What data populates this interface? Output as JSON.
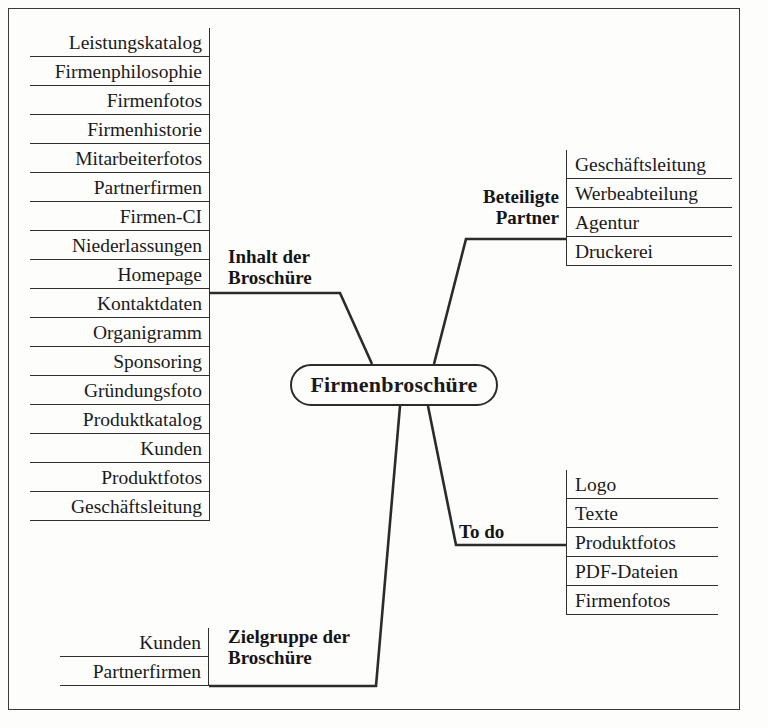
{
  "diagram": {
    "title": "Firmenbroschüre",
    "type": "mind-map",
    "ink_color": "#2b2b2b",
    "paper_color": "#fdfdfc"
  },
  "central": {
    "label": "Firmenbroschüre"
  },
  "branches": {
    "inhalt": {
      "label": "Inhalt der\nBroschüre",
      "items": [
        "Leistungskatalog",
        "Firmenphilosophie",
        "Firmenfotos",
        "Firmenhistorie",
        "Mitarbeiterfotos",
        "Partnerfirmen",
        "Firmen-CI",
        "Niederlassungen",
        "Homepage",
        "Kontaktdaten",
        "Organigramm",
        "Sponsoring",
        "Gründungsfoto",
        "Produktkatalog",
        "Kunden",
        "Produktfotos",
        "Geschäftsleitung"
      ]
    },
    "partner": {
      "label": "Beteiligte\nPartner",
      "items": [
        "Geschäftsleitung",
        "Werbeabteilung",
        "Agentur",
        "Druckerei"
      ]
    },
    "todo": {
      "label": "To do",
      "items": [
        "Logo",
        "Texte",
        "Produktfotos",
        "PDF-Dateien",
        "Firmenfotos"
      ]
    },
    "zielgruppe": {
      "label": "Zielgruppe der\nBroschüre",
      "items": [
        "Kunden",
        "Partnerfirmen"
      ]
    }
  }
}
